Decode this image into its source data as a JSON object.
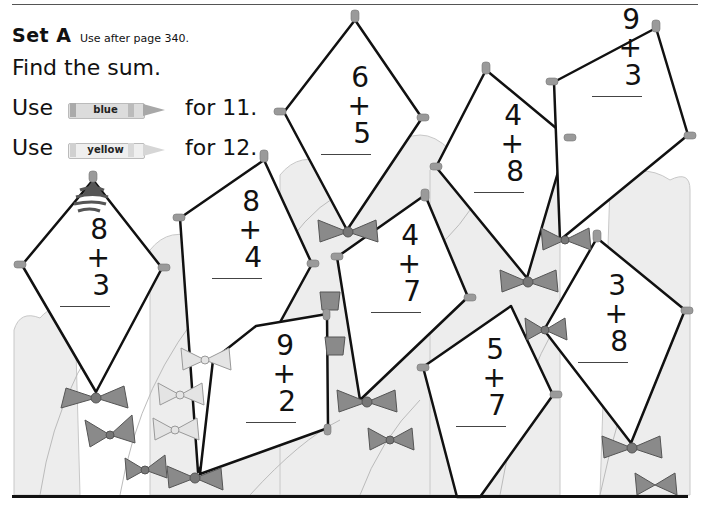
{
  "header": {
    "set_title": "Set A",
    "set_subtitle": "Use after page 340.",
    "instruction": "Find the sum."
  },
  "color_keys": [
    {
      "prefix": "Use",
      "crayon_label": "blue",
      "suffix": "for 11.",
      "crayon_color": "#d8d8d8"
    },
    {
      "prefix": "Use",
      "crayon_label": "yellow",
      "suffix": "for 12.",
      "crayon_color": "#ececec"
    }
  ],
  "kites": [
    {
      "id": "k1",
      "top": "8",
      "bottom": "+ 3",
      "answer_hint": "11"
    },
    {
      "id": "k2",
      "top": "8",
      "bottom": "+ 4",
      "answer_hint": "12"
    },
    {
      "id": "k3",
      "top": "6",
      "bottom": "+ 5",
      "answer_hint": "11"
    },
    {
      "id": "k4",
      "top": "9",
      "bottom": "+ 2",
      "answer_hint": "11"
    },
    {
      "id": "k5",
      "top": "4",
      "bottom": "+ 7",
      "answer_hint": "11"
    },
    {
      "id": "k6",
      "top": "4",
      "bottom": "+ 8",
      "answer_hint": "12"
    },
    {
      "id": "k7",
      "top": "9",
      "bottom": "+ 3",
      "answer_hint": "12"
    },
    {
      "id": "k8",
      "top": "5",
      "bottom": "+ 7",
      "answer_hint": "12"
    },
    {
      "id": "k9",
      "top": "3",
      "bottom": "+ 8",
      "answer_hint": "11"
    }
  ],
  "colors": {
    "outline": "#111111",
    "bow": "#8a8a8a",
    "bow_light": "#d6d6d6",
    "cloud": "#ececec",
    "tack": "#9a9a9a"
  }
}
